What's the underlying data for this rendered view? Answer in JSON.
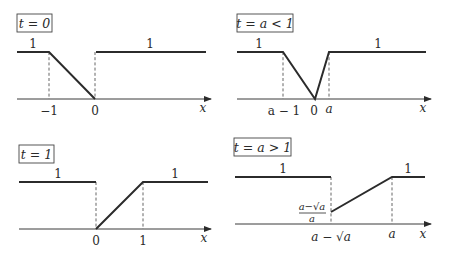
{
  "panels": [
    {
      "title": "t = 0",
      "ticks": [
        "−1",
        "0"
      ],
      "level_labels": [
        "1",
        "1"
      ],
      "axis_label": "x"
    },
    {
      "title": "t = a < 1",
      "ticks": [
        "a − 1",
        "0",
        "a"
      ],
      "level_labels": [
        "1",
        "1"
      ],
      "axis_label": "x"
    },
    {
      "title": "t = 1",
      "ticks": [
        "0",
        "1"
      ],
      "level_labels": [
        "1",
        "1"
      ],
      "axis_label": "x"
    },
    {
      "title": "t = a > 1",
      "ticks": [
        "a − √a",
        "a"
      ],
      "level_labels": [
        "1",
        "1"
      ],
      "value_label_num": "a−√a",
      "value_label_den": "a",
      "axis_label": "x"
    }
  ]
}
